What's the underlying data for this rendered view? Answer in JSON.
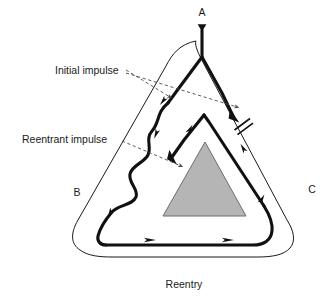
{
  "figure": {
    "caption": "Reentry",
    "background_color": "#ffffff",
    "ink_color": "#1a1a1a",
    "core_fill_color": "#b5b5b5",
    "core_stroke_color": "#6d6d6d"
  },
  "nodes": [
    {
      "id": "A",
      "label": "A",
      "x": 202,
      "y": 16,
      "role": "proximal-input-branch-point"
    },
    {
      "id": "B",
      "label": "B",
      "x": 77,
      "y": 196,
      "role": "left-limb-region"
    },
    {
      "id": "C",
      "label": "C",
      "x": 312,
      "y": 193,
      "role": "right-limb-region"
    }
  ],
  "annotations": [
    {
      "id": "initial-impulse",
      "label": "Initial impulse",
      "text_x": 55,
      "text_y": 71,
      "leader_count": 2,
      "points_to": [
        "left-branch",
        "right-branch"
      ]
    },
    {
      "id": "reentrant-impulse",
      "label": "Reentrant impulse",
      "text_x": 22,
      "text_y": 140,
      "leader_count": 1,
      "points_to": [
        "slow-wavy-limb"
      ]
    }
  ],
  "symbols": [
    {
      "id": "conduction-block",
      "name": "double-bar-block-symbol",
      "description": "two short parallel bars crossing the right branch",
      "x": 239,
      "y": 125
    },
    {
      "id": "input-arrowhead",
      "name": "down-arrowhead",
      "description": "arrowhead below label A indicating impulse entry",
      "x": 202,
      "y": 28
    }
  ],
  "flow_arrows": [
    {
      "id": "arrow-left-branch-down",
      "x": 166,
      "y": 99,
      "angle": 128,
      "limb": "left-branch"
    },
    {
      "id": "arrow-right-branch-down",
      "x": 228,
      "y": 112,
      "angle": 56,
      "limb": "right-branch"
    },
    {
      "id": "arrow-inner-apex-up",
      "x": 190,
      "y": 129,
      "angle": -62,
      "limb": "inner-left-edge"
    },
    {
      "id": "arrow-wavy-down-upper",
      "x": 160,
      "y": 133,
      "angle": 110,
      "limb": "slow-wavy-limb"
    },
    {
      "id": "arrow-wavy-down-mid",
      "x": 169,
      "y": 163,
      "angle": 104,
      "limb": "slow-wavy-limb"
    },
    {
      "id": "arrow-wavy-down-lower",
      "x": 104,
      "y": 212,
      "angle": 118,
      "limb": "slow-wavy-limb"
    },
    {
      "id": "arrow-bottom-right-1",
      "x": 150,
      "y": 240,
      "angle": 0,
      "limb": "bottom-limb"
    },
    {
      "id": "arrow-bottom-right-2",
      "x": 228,
      "y": 240,
      "angle": 0,
      "limb": "bottom-limb"
    },
    {
      "id": "arrow-right-inner-up",
      "x": 245,
      "y": 147,
      "angle": -118,
      "limb": "inner-right-edge"
    },
    {
      "id": "arrow-right-limb-up",
      "x": 262,
      "y": 199,
      "angle": -68,
      "limb": "right-limb"
    }
  ],
  "shapes": {
    "outer_boundary": "rounded-triangle-outline",
    "inner_core": "gray-filled-triangle",
    "circuit": "thick-reentrant-loop"
  }
}
